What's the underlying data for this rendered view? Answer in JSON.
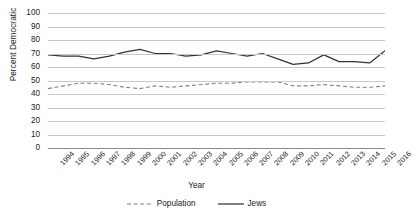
{
  "chart_data": {
    "type": "line",
    "title": "",
    "xlabel": "Year",
    "ylabel": "Percent Democratic",
    "ylim": [
      0,
      100
    ],
    "ytick_step": 10,
    "yticks": [
      100,
      90,
      80,
      70,
      60,
      50,
      40,
      30,
      20,
      10,
      0
    ],
    "grid": "horizontal",
    "legend_position": "bottom-center",
    "categories": [
      "1994",
      "1995",
      "1996",
      "1997",
      "1998",
      "1999",
      "2000",
      "2001",
      "2002",
      "2003",
      "2004",
      "2005",
      "2006",
      "2007",
      "2008",
      "2009",
      "2010",
      "2011",
      "2012",
      "2013",
      "2014",
      "2015",
      "2016"
    ],
    "series": [
      {
        "name": "Population",
        "style": "dashed",
        "color": "#808080",
        "values": [
          44,
          46,
          48,
          48,
          47,
          45,
          44,
          46,
          45,
          46,
          47,
          48,
          48,
          49,
          49,
          49,
          46,
          46,
          47,
          46,
          45,
          45,
          46
        ]
      },
      {
        "name": "Jews",
        "style": "solid",
        "color": "#333333",
        "values": [
          69,
          68,
          68,
          66,
          68,
          71,
          73,
          70,
          70,
          68,
          69,
          72,
          70,
          68,
          70,
          66,
          62,
          63,
          69,
          64,
          64,
          63,
          72
        ]
      }
    ]
  },
  "legend": {
    "entries": [
      {
        "label": "Population"
      },
      {
        "label": "Jews"
      }
    ]
  }
}
